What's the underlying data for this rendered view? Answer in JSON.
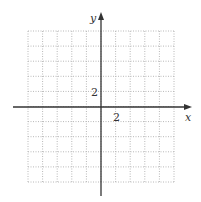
{
  "figure": {
    "type": "coordinate-grid",
    "x_axis_label": "x",
    "y_axis_label": "y",
    "x_tick_label": "2",
    "y_tick_label": "2",
    "grid": {
      "columns": 10,
      "rows": 10,
      "units_per_cell": 2,
      "x_range": [
        -10,
        10
      ],
      "y_range": [
        -10,
        10
      ],
      "style": "dotted",
      "color": "#b8b8b8"
    },
    "axis_color": "#333333",
    "background": "#ffffff"
  }
}
